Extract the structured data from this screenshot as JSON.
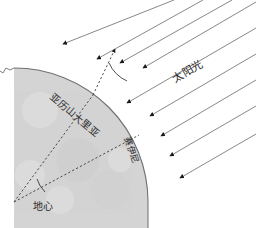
{
  "figure": {
    "background_color": "#ffffff",
    "width": 256,
    "height": 228
  },
  "colors": {
    "earth_fill": "#d4d4d4",
    "earth_edge": "#6f6f6f",
    "ray_line": "#7a7a7a",
    "arrow_head": "#1a1a1a",
    "dashed_line": "#3a3a3a",
    "angle_arc": "#3a3a3a",
    "label_text": "#2b2b2b"
  },
  "labels": {
    "sunlight": "太阳光",
    "alexandria": "亚历山大里亚",
    "syene": "赛伊尼",
    "earth_center": "地心"
  },
  "geometry": {
    "earth_center_point": {
      "x": 14,
      "y": 202
    },
    "earth_radius": 134,
    "alexandria_point": {
      "x": 93,
      "y": 95
    },
    "syene_point": {
      "x": 139,
      "y": 135
    },
    "ray_angle_deg": -30,
    "sun_ray_count": 9
  },
  "sun_rays": [
    {
      "x1": 256,
      "y1": 0,
      "x2": 141,
      "y2": 69
    },
    {
      "x1": 256,
      "y1": 24,
      "x2": 122,
      "y2": 102
    },
    {
      "x1": 256,
      "y1": 50,
      "x2": 147,
      "y2": 113
    },
    {
      "x1": 256,
      "y1": 76,
      "x2": 159,
      "y2": 132
    },
    {
      "x1": 256,
      "y1": 102,
      "x2": 168,
      "y2": 153
    },
    {
      "x1": 256,
      "y1": 128,
      "x2": 178,
      "y2": 173
    },
    {
      "x1": 228,
      "y1": 0,
      "x2": 119,
      "y2": 61
    },
    {
      "x1": 199,
      "y1": 0,
      "x2": 96,
      "y2": 58
    },
    {
      "x1": 170,
      "y1": 0,
      "x2": 62,
      "y2": 43
    }
  ],
  "dashed_lines": [
    {
      "name": "center-to-alexandria",
      "x1": 14,
      "y1": 202,
      "x2": 93,
      "y2": 95
    },
    {
      "name": "center-to-syene",
      "x1": 14,
      "y1": 202,
      "x2": 139,
      "y2": 135
    },
    {
      "name": "alexandria-gnomon",
      "x1": 93,
      "y1": 95,
      "x2": 114,
      "y2": 47
    }
  ],
  "angle_arcs": [
    {
      "name": "alexandria-angle",
      "cx": 93,
      "cy": 95,
      "r": 36
    },
    {
      "name": "earth-center-angle",
      "cx": 14,
      "cy": 202,
      "r": 32
    }
  ],
  "icons": {
    "arrowhead": "triangle-arrow-icon"
  }
}
